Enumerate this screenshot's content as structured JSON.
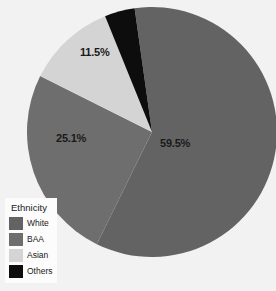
{
  "chart_data": {
    "type": "pie",
    "title": "",
    "categories": [
      "White",
      "BAA",
      "Asian",
      "Others"
    ],
    "values": [
      59.5,
      25.1,
      11.5,
      3.9
    ],
    "labels": [
      "59.5%",
      "25.1%",
      "11.5%",
      ""
    ],
    "colors": [
      "#636363",
      "#6e6e6e",
      "#d4d4d4",
      "#0d0d0d"
    ],
    "legend": {
      "title": "Ethnicity",
      "position": "bottom-left",
      "entries": [
        {
          "label": "White",
          "color": "#636363"
        },
        {
          "label": "BAA",
          "color": "#6e6e6e"
        },
        {
          "label": "Asian",
          "color": "#d4d4d4"
        },
        {
          "label": "Others",
          "color": "#0d0d0d"
        }
      ]
    },
    "start_angle": -8,
    "direction": "clockwise",
    "background": "#f2f2f2",
    "grid": false,
    "xlabel": "",
    "ylabel": ""
  }
}
